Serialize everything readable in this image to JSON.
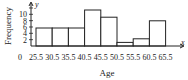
{
  "chart_data": {
    "type": "bar",
    "subtype": "histogram",
    "title": "",
    "xlabel": "Age",
    "ylabel": "Frequency",
    "x_axis_symbol": "x",
    "y_axis_symbol": "y",
    "bin_edges": [
      25.5,
      30.5,
      35.5,
      40.5,
      45.5,
      50.5,
      55.5,
      60.5,
      65.5
    ],
    "categories": [
      "25.5-30.5",
      "30.5-35.5",
      "35.5-40.5",
      "40.5-45.5",
      "45.5-50.5",
      "50.5-55.5",
      "55.5-60.5",
      "60.5-65.5"
    ],
    "values": [
      5,
      5,
      5,
      10,
      8,
      1,
      2,
      7
    ],
    "x_tick_labels": [
      "0",
      "25.5",
      "30.5",
      "35.5",
      "40.5",
      "45.5",
      "50.5",
      "55.5",
      "60.5",
      "65.5"
    ],
    "y_tick_labels": [
      "2",
      "4",
      "6",
      "8",
      "10"
    ],
    "ylim": [
      0,
      12
    ],
    "grid": false,
    "legend": null,
    "bar_fill": "#ffffff",
    "bar_stroke": "#222222"
  }
}
